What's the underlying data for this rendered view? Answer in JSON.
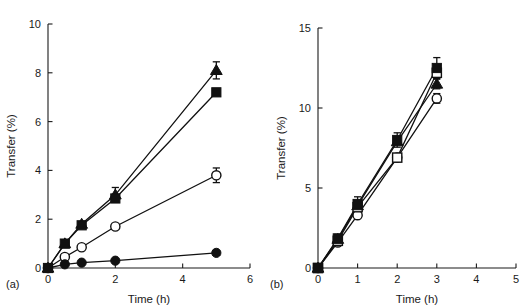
{
  "figure": {
    "panel_a_label": "(a)",
    "panel_b_label": "(b)",
    "ink_color": "#111111"
  },
  "chart_data": [
    {
      "type": "line",
      "panel": "(a)",
      "title": "",
      "xlabel": "Time (h)",
      "ylabel": "Transfer (%)",
      "xlim": [
        0,
        6
      ],
      "ylim": [
        0,
        10
      ],
      "xticks": [
        0,
        2,
        4,
        6
      ],
      "xtick_labels": [
        "0",
        "2",
        "4",
        "6"
      ],
      "yticks": [
        0,
        2,
        4,
        6,
        8,
        10
      ],
      "ytick_labels": [
        "0",
        "2",
        "4",
        "6",
        "8",
        "10"
      ],
      "grid": false,
      "legend": "none",
      "series": [
        {
          "name": "filled-triangle",
          "marker": "filled-triangle",
          "x": [
            0,
            0.5,
            1,
            2,
            5
          ],
          "values": [
            0,
            1.0,
            1.8,
            3.0,
            8.1
          ],
          "errors": [
            0,
            0,
            0,
            0.3,
            0.35
          ]
        },
        {
          "name": "filled-square",
          "marker": "filled-square",
          "x": [
            0,
            0.5,
            1,
            2,
            5
          ],
          "values": [
            0,
            1.0,
            1.75,
            2.85,
            7.2
          ],
          "errors": [
            0,
            0,
            0,
            0,
            0
          ]
        },
        {
          "name": "open-circle",
          "marker": "open-circle",
          "x": [
            0,
            0.5,
            1,
            2,
            5
          ],
          "values": [
            0,
            0.45,
            0.85,
            1.7,
            3.8
          ],
          "errors": [
            0,
            0,
            0,
            0,
            0.3
          ]
        },
        {
          "name": "filled-circle",
          "marker": "filled-circle",
          "x": [
            0,
            0.5,
            1,
            2,
            5
          ],
          "values": [
            0,
            0.15,
            0.22,
            0.3,
            0.62
          ],
          "errors": [
            0,
            0,
            0,
            0,
            0
          ]
        }
      ]
    },
    {
      "type": "line",
      "panel": "(b)",
      "title": "",
      "xlabel": "Time (h)",
      "ylabel": "Transfer (%)",
      "xlim": [
        0,
        5
      ],
      "ylim": [
        0,
        15
      ],
      "xticks": [
        0,
        1,
        2,
        3,
        4,
        5
      ],
      "xtick_labels": [
        "0",
        "1",
        "2",
        "3",
        "4",
        "5"
      ],
      "yticks": [
        0,
        5,
        10,
        15
      ],
      "ytick_labels": [
        "0",
        "5",
        "10",
        "15"
      ],
      "grid": false,
      "legend": "none",
      "series": [
        {
          "name": "filled-square",
          "marker": "filled-square",
          "x": [
            0,
            0.5,
            1,
            2,
            3
          ],
          "values": [
            0,
            1.85,
            4.0,
            8.0,
            12.5
          ],
          "errors": [
            0,
            0.25,
            0.45,
            0.45,
            0.65
          ]
        },
        {
          "name": "filled-triangle",
          "marker": "filled-triangle",
          "x": [
            0,
            0.5,
            1,
            2,
            3
          ],
          "values": [
            0,
            1.8,
            3.9,
            7.9,
            11.5
          ],
          "errors": [
            0,
            0,
            0,
            0,
            0.3
          ]
        },
        {
          "name": "open-square",
          "marker": "open-square",
          "x": [
            0,
            0.5,
            1,
            2,
            3
          ],
          "values": [
            0,
            1.7,
            3.8,
            6.9,
            12.2
          ],
          "errors": [
            0,
            0,
            0,
            0,
            0
          ]
        },
        {
          "name": "open-circle",
          "marker": "open-circle",
          "x": [
            0,
            0.5,
            1,
            2,
            3
          ],
          "values": [
            0,
            1.6,
            3.3,
            6.9,
            10.6
          ],
          "errors": [
            0,
            0,
            0,
            0,
            0.3
          ]
        }
      ]
    }
  ]
}
